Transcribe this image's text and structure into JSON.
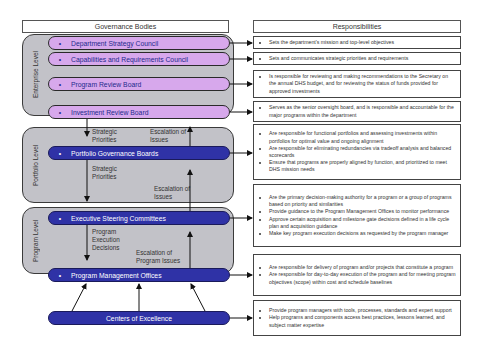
{
  "headers": {
    "governance": "Governance Bodies",
    "responsibilities": "Responsibilities"
  },
  "levels": {
    "enterprise": "Enterprise Level",
    "portfolio": "Portfolio Level",
    "program": "Program Level"
  },
  "bodies": [
    {
      "name": "Department Strategy Council",
      "bullet": "•"
    },
    {
      "name": "Capabilities and Requirements Council",
      "bullet": "•"
    },
    {
      "name": "Program Review Board",
      "bullet": "•"
    },
    {
      "name": "Investment Review Board",
      "bullet": "•"
    },
    {
      "name": "Portfolio Governance Boards",
      "bullet": "•"
    },
    {
      "name": "Executive Steering Committees",
      "bullet": "•"
    },
    {
      "name": "Program Management Offices",
      "bullet": "•"
    },
    {
      "name": "Centers of Excellence",
      "bullet": ""
    }
  ],
  "responsibilities": [
    [
      "Sets the department's mission and top-level objectives"
    ],
    [
      "Sets and communicates strategic priorities and requirements"
    ],
    [
      "Is responsible for reviewing and making recommendations to the Secretary on the annual DHS budget, and for reviewing the status of funds provided for approved investments"
    ],
    [
      "Serves as the senior oversight board, and is responsible and accountable for the major programs within the department"
    ],
    [
      "Are responsible for functional portfolios and assessing investments within portfolios for optimal value and ongoing alignment",
      "Are responsible for eliminating redundancies via tradeoff analysis and balanced scorecards",
      "Ensure that programs are properly aligned by function, and prioritized to meet DHS mission needs"
    ],
    [
      "Are the primary decision-making authority for a program or a group of programs based on priority and similarities",
      "Provide guidance to the Program Management Offices to monitor performance",
      "Approve certain acquisition and milestone gate decisions defined in a life cycle plan and acquisition guidance",
      "Make key program execution decisions as requested by the program manager"
    ],
    [
      "Are responsible for delivery of program and/or projects that constitute a program",
      "Are responsible for day-to-day execution of the program and for meeting program objectives (scope) within cost and schedule baselines"
    ],
    [
      "Provide program managers with tools, processes, standards and expert support",
      "Help programs and components access best practices, lessons learned, and subject matter expertise"
    ]
  ],
  "flow_labels": {
    "strategic_priorities_1": "Strategic Priorities",
    "escalation_1": "Escalation of Issues",
    "strategic_priorities_2": "Strategic Priorities",
    "escalation_2": "Escalation of Issues",
    "program_execution": "Program Execution Decisions",
    "escalation_program": "Escalation of Program Issues"
  },
  "colors": {
    "light_pill": "#d7a8ec",
    "dark_pill": "#2f32a6",
    "group_bg": "#c2c2c8"
  }
}
